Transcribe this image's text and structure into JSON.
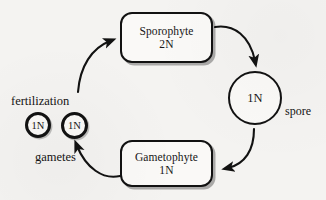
{
  "diagram": {
    "background_color": "#f4f3f1",
    "stroke_color": "#121212",
    "nodes": [
      {
        "id": "sporophyte",
        "shape": "rounded-rect",
        "line1": "Sporophyte",
        "line2": "2N"
      },
      {
        "id": "gametophyte",
        "shape": "rounded-rect",
        "line1": "Gametophyte",
        "line2": "1N"
      },
      {
        "id": "spore_circle",
        "shape": "circle",
        "label": "1N"
      },
      {
        "id": "gamete_left",
        "shape": "circle",
        "label": "1N"
      },
      {
        "id": "gamete_right",
        "shape": "circle",
        "label": "1N"
      }
    ],
    "labels": {
      "fertilization": "fertilization",
      "gametes": "gametes",
      "spore": "spore"
    },
    "arrows": [
      {
        "id": "sporophyte-to-spore",
        "from": "sporophyte",
        "to": "spore_circle",
        "direction": "clockwise"
      },
      {
        "id": "spore-to-gametophyte",
        "from": "spore_circle",
        "to": "gametophyte",
        "direction": "clockwise"
      },
      {
        "id": "gametophyte-to-gametes",
        "from": "gametophyte",
        "to": "gamete_right",
        "direction": "clockwise"
      },
      {
        "id": "fertilization-to-sporophyte",
        "from": "gametes",
        "to": "sporophyte",
        "direction": "clockwise"
      }
    ]
  }
}
